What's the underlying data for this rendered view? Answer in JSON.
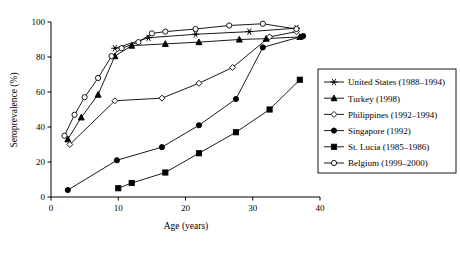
{
  "chart_data": {
    "type": "line",
    "title": "",
    "xlabel": "Age (years)",
    "ylabel": "Seroprevalence (%)",
    "xlim": [
      0,
      40
    ],
    "ylim": [
      0,
      100
    ],
    "xticks": [
      0,
      10,
      20,
      30,
      40
    ],
    "yticks": [
      0,
      20,
      40,
      60,
      80,
      100
    ],
    "grid": false,
    "legend_position": "right-outside",
    "series": [
      {
        "name": "United States (1988–1994)",
        "marker": "asterisk-star",
        "marker_fill": "open",
        "points": [
          {
            "x": 9.5,
            "y": 85.0
          },
          {
            "x": 14.5,
            "y": 91.0
          },
          {
            "x": 21.5,
            "y": 93.0
          },
          {
            "x": 29.5,
            "y": 94.5
          },
          {
            "x": 36.5,
            "y": 96.5
          }
        ]
      },
      {
        "name": "Turkey (1998)",
        "marker": "triangle-up",
        "marker_fill": "filled",
        "points": [
          {
            "x": 2.5,
            "y": 33.0
          },
          {
            "x": 4.5,
            "y": 45.5
          },
          {
            "x": 7.0,
            "y": 58.5
          },
          {
            "x": 9.5,
            "y": 80.5
          },
          {
            "x": 12.0,
            "y": 86.5
          },
          {
            "x": 17.0,
            "y": 87.5
          },
          {
            "x": 22.0,
            "y": 88.5
          },
          {
            "x": 28.0,
            "y": 90.0
          },
          {
            "x": 32.0,
            "y": 90.5
          },
          {
            "x": 37.0,
            "y": 91.5
          }
        ]
      },
      {
        "name": "Philippines (1992–1994)",
        "marker": "diamond",
        "marker_fill": "open",
        "points": [
          {
            "x": 2.8,
            "y": 30.0
          },
          {
            "x": 9.5,
            "y": 55.0
          },
          {
            "x": 16.5,
            "y": 56.5
          },
          {
            "x": 22.0,
            "y": 65.0
          },
          {
            "x": 27.0,
            "y": 74.0
          },
          {
            "x": 32.5,
            "y": 91.5
          },
          {
            "x": 36.5,
            "y": 94.5
          }
        ]
      },
      {
        "name": "Singapore (1992)",
        "marker": "circle",
        "marker_fill": "filled",
        "points": [
          {
            "x": 2.5,
            "y": 4.0
          },
          {
            "x": 9.8,
            "y": 21.0
          },
          {
            "x": 16.5,
            "y": 28.5
          },
          {
            "x": 22.0,
            "y": 41.0
          },
          {
            "x": 27.5,
            "y": 56.0
          },
          {
            "x": 31.5,
            "y": 85.5
          },
          {
            "x": 37.5,
            "y": 92.0
          }
        ]
      },
      {
        "name": "St. Lucia (1985–1986)",
        "marker": "square",
        "marker_fill": "filled",
        "points": [
          {
            "x": 10.0,
            "y": 5.0
          },
          {
            "x": 12.0,
            "y": 8.0
          },
          {
            "x": 17.0,
            "y": 14.0
          },
          {
            "x": 22.0,
            "y": 25.0
          },
          {
            "x": 27.5,
            "y": 37.0
          },
          {
            "x": 32.5,
            "y": 50.0
          },
          {
            "x": 37.0,
            "y": 67.0
          }
        ]
      },
      {
        "name": "Belgium (1999–2000)",
        "marker": "circle",
        "marker_fill": "open",
        "points": [
          {
            "x": 2.0,
            "y": 35.0
          },
          {
            "x": 3.5,
            "y": 47.0
          },
          {
            "x": 5.0,
            "y": 57.0
          },
          {
            "x": 7.0,
            "y": 68.0
          },
          {
            "x": 9.0,
            "y": 80.5
          },
          {
            "x": 10.5,
            "y": 85.0
          },
          {
            "x": 13.0,
            "y": 88.5
          },
          {
            "x": 15.0,
            "y": 93.5
          },
          {
            "x": 17.0,
            "y": 94.5
          },
          {
            "x": 21.5,
            "y": 96.0
          },
          {
            "x": 26.5,
            "y": 98.0
          },
          {
            "x": 31.5,
            "y": 99.0
          },
          {
            "x": 36.5,
            "y": 96.0
          }
        ]
      }
    ]
  },
  "legend": {
    "items": [
      {
        "label": "United States (1988–1994)",
        "marker": "asterisk-star"
      },
      {
        "label": "Turkey (1998)",
        "marker": "triangle-up"
      },
      {
        "label": "Philippines (1992–1994)",
        "marker": "diamond-open"
      },
      {
        "label": "Singapore (1992)",
        "marker": "circle-filled"
      },
      {
        "label": "St. Lucia (1985–1986)",
        "marker": "square-filled"
      },
      {
        "label": "Belgium (1999–2000)",
        "marker": "circle-open"
      }
    ]
  },
  "colors": {
    "ink": "#000000",
    "background": "#ffffff"
  }
}
